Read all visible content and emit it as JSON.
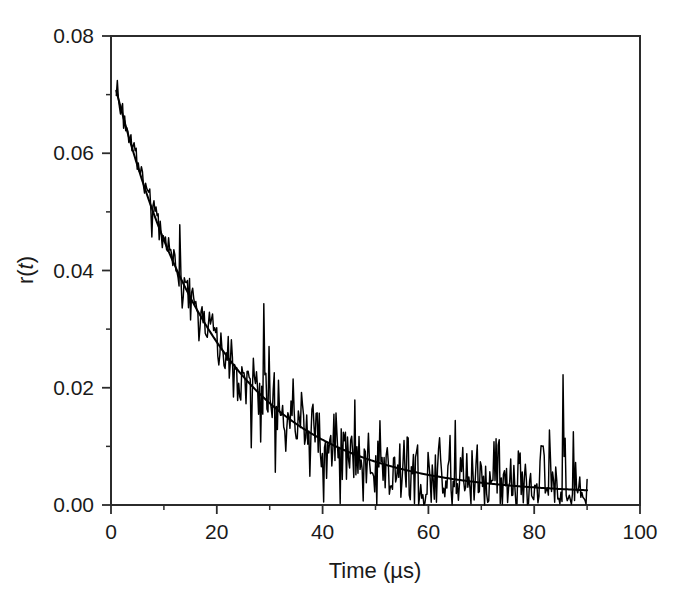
{
  "chart_data": {
    "type": "line",
    "title": "",
    "subtitle": "",
    "xlabel": "Time (µs)",
    "ylabel": "r(t)",
    "ylabel_parts": {
      "pre": "r",
      "open": "(",
      "italic": "t",
      "close": ")"
    },
    "xlim": [
      0,
      100
    ],
    "ylim": [
      0.0,
      0.08
    ],
    "grid": false,
    "legend": null,
    "legend_position": "none",
    "x_ticks": [
      0,
      20,
      40,
      60,
      80,
      100
    ],
    "x_tick_labels": [
      "0",
      "20",
      "40",
      "60",
      "80",
      "100"
    ],
    "x_minor_ticks": [
      10,
      30,
      50,
      70,
      90
    ],
    "y_ticks": [
      0.0,
      0.02,
      0.04,
      0.06,
      0.08
    ],
    "y_tick_labels": [
      "0.00",
      "0.02",
      "0.04",
      "0.06",
      "0.08"
    ],
    "y_minor_ticks": [
      0.01,
      0.03,
      0.05,
      0.07
    ],
    "axis_color": "#2b2b2b",
    "data_color": "#000000",
    "fit_color": "#000000",
    "background": "#ffffff",
    "series": [
      {
        "name": "anisotropy decay data",
        "style": "noisy-trace",
        "x_start": 1.0,
        "x_end": 90.0,
        "n_points": 450,
        "description": "Noisy experimental anisotropy decay from r=0.0735 at t=1 us toward baseline near 0.002 beyond t=60 us; noise amplitude grows as signal decays."
      },
      {
        "name": "exponential fit",
        "style": "smooth-line",
        "model": "r0*exp(-t/phi) + r_inf",
        "r0": 0.0725,
        "phi": 19.5,
        "r_inf": 0.0018,
        "x_start": 1.0,
        "x_end": 90.0,
        "description": "Smooth single-exponential fit overlaid on the noisy trace."
      }
    ],
    "data_points_fit": {
      "t": [
        0,
        5,
        10,
        15,
        20,
        25,
        30,
        35,
        40,
        45,
        50,
        55,
        60,
        65,
        70,
        75,
        80,
        85,
        90
      ],
      "r": [
        0.0743,
        0.0578,
        0.0446,
        0.0345,
        0.0269,
        0.0211,
        0.0167,
        0.0134,
        0.0109,
        0.0089,
        0.0075,
        0.0063,
        0.0054,
        0.0047,
        0.0042,
        0.0038,
        0.0035,
        0.0032,
        0.003
      ]
    }
  },
  "figure": {
    "plot_left_px": 111,
    "plot_right_px": 640,
    "plot_top_px": 36,
    "plot_bottom_px": 505
  }
}
